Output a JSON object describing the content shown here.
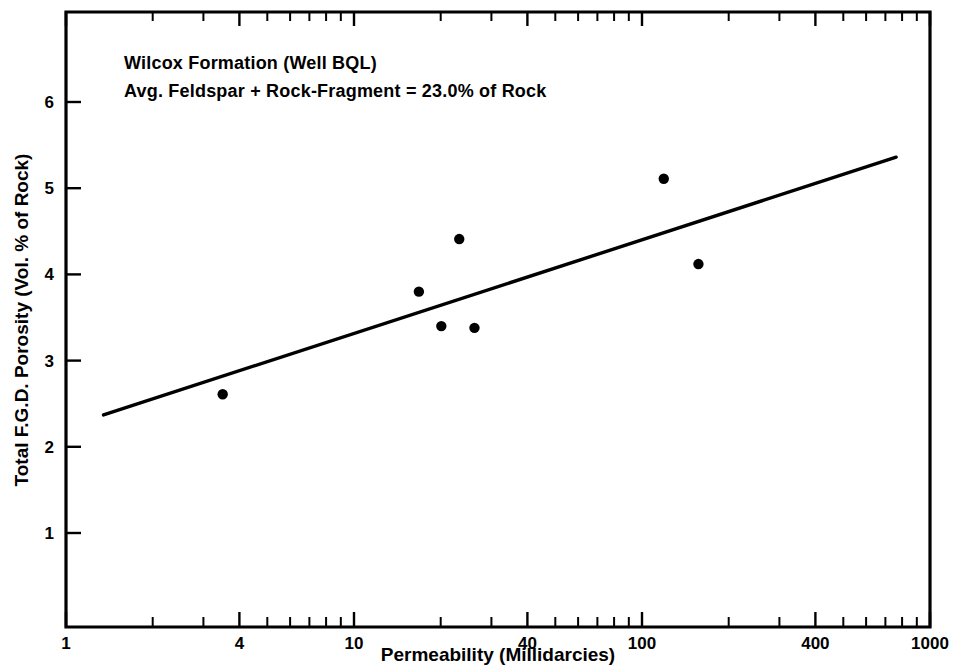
{
  "chart_data": {
    "type": "scatter",
    "title": "",
    "xlabel": "Permeability (Millidarcies)",
    "ylabel": "Total F.G.D. Porosity (Vol. % of Rock)",
    "xscale": "log",
    "yscale": "linear",
    "xlim": [
      1,
      1000
    ],
    "ylim": [
      0,
      6.85
    ],
    "grid": false,
    "legend": null,
    "x_ticks": [
      {
        "value": 1,
        "label": "1"
      },
      {
        "value": 2,
        "label": ""
      },
      {
        "value": 3,
        "label": ""
      },
      {
        "value": 4,
        "label": "4"
      },
      {
        "value": 5,
        "label": ""
      },
      {
        "value": 6,
        "label": ""
      },
      {
        "value": 7,
        "label": ""
      },
      {
        "value": 8,
        "label": ""
      },
      {
        "value": 9,
        "label": ""
      },
      {
        "value": 10,
        "label": "10"
      },
      {
        "value": 20,
        "label": ""
      },
      {
        "value": 30,
        "label": ""
      },
      {
        "value": 40,
        "label": "40"
      },
      {
        "value": 50,
        "label": ""
      },
      {
        "value": 60,
        "label": ""
      },
      {
        "value": 70,
        "label": ""
      },
      {
        "value": 80,
        "label": ""
      },
      {
        "value": 90,
        "label": ""
      },
      {
        "value": 100,
        "label": "100"
      },
      {
        "value": 200,
        "label": ""
      },
      {
        "value": 300,
        "label": ""
      },
      {
        "value": 400,
        "label": "400"
      },
      {
        "value": 500,
        "label": ""
      },
      {
        "value": 600,
        "label": ""
      },
      {
        "value": 700,
        "label": ""
      },
      {
        "value": 800,
        "label": ""
      },
      {
        "value": 900,
        "label": ""
      },
      {
        "value": 1000,
        "label": "1000"
      }
    ],
    "y_ticks": [
      {
        "value": 1,
        "label": "1"
      },
      {
        "value": 2,
        "label": "2"
      },
      {
        "value": 3,
        "label": "3"
      },
      {
        "value": 4,
        "label": "4"
      },
      {
        "value": 5,
        "label": "5"
      },
      {
        "value": 6,
        "label": "6"
      }
    ],
    "points": [
      {
        "x": 3.5,
        "y": 2.61
      },
      {
        "x": 16.8,
        "y": 3.8
      },
      {
        "x": 20.1,
        "y": 3.4
      },
      {
        "x": 23.2,
        "y": 4.41
      },
      {
        "x": 26.2,
        "y": 3.38
      },
      {
        "x": 119.0,
        "y": 5.11
      },
      {
        "x": 157.0,
        "y": 4.12
      }
    ],
    "trend_line": {
      "x_start": 1.35,
      "y_start": 2.37,
      "x_end": 763.0,
      "y_end": 5.36
    },
    "annotations": [
      {
        "line": "Wilcox Formation (Well BQL)"
      },
      {
        "line": "Avg. Feldspar + Rock-Fragment = 23.0% of Rock"
      }
    ],
    "colors": {
      "axis": "#000000",
      "marker": "#000000",
      "trend": "#000000",
      "background": "#ffffff"
    }
  }
}
